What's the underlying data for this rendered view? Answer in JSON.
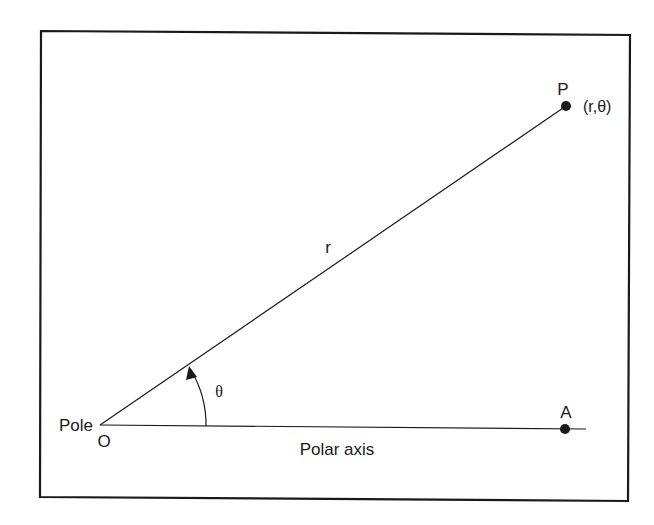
{
  "diagram": {
    "colors": {
      "background": "#ffffff",
      "stroke": "#1a1a1a",
      "frame": "#1a1a1a"
    },
    "labels": {
      "pole": "Pole",
      "origin": "O",
      "point_p": "P",
      "point_p_coords": "(r,θ)",
      "radius": "r",
      "angle": "θ",
      "point_a": "A",
      "polar_axis": "Polar axis"
    },
    "points": {
      "origin": {
        "x": 100,
        "y": 425
      },
      "P": {
        "x": 566,
        "y": 106
      },
      "A": {
        "x": 565,
        "y": 429
      }
    },
    "icons": {
      "arrowhead": "arc-arrow-icon",
      "point_marker": "filled-circle-icon"
    }
  }
}
